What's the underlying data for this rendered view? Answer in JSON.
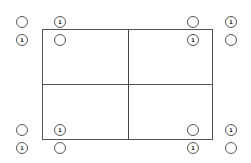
{
  "diagram": {
    "title": "",
    "rectangle": {
      "quadrants": [
        "top-left",
        "top-right",
        "bottom-left",
        "bottom-right"
      ]
    },
    "marker_label": "1",
    "groups": [
      {
        "position": "top-left",
        "circles": [
          {
            "x": 16,
            "y": 16,
            "label": ""
          },
          {
            "x": 54,
            "y": 16,
            "label": "1"
          },
          {
            "x": 16,
            "y": 34,
            "label": "1"
          },
          {
            "x": 54,
            "y": 34,
            "label": ""
          }
        ]
      },
      {
        "position": "top-right",
        "circles": [
          {
            "x": 187,
            "y": 16,
            "label": ""
          },
          {
            "x": 225,
            "y": 16,
            "label": "1"
          },
          {
            "x": 187,
            "y": 34,
            "label": "1"
          },
          {
            "x": 225,
            "y": 34,
            "label": ""
          }
        ]
      },
      {
        "position": "bottom-left",
        "circles": [
          {
            "x": 16,
            "y": 124,
            "label": ""
          },
          {
            "x": 54,
            "y": 124,
            "label": "1"
          },
          {
            "x": 16,
            "y": 142,
            "label": "1"
          },
          {
            "x": 54,
            "y": 142,
            "label": ""
          }
        ]
      },
      {
        "position": "bottom-right",
        "circles": [
          {
            "x": 187,
            "y": 124,
            "label": ""
          },
          {
            "x": 225,
            "y": 124,
            "label": "1"
          },
          {
            "x": 187,
            "y": 142,
            "label": "1"
          },
          {
            "x": 225,
            "y": 142,
            "label": ""
          }
        ]
      }
    ]
  }
}
